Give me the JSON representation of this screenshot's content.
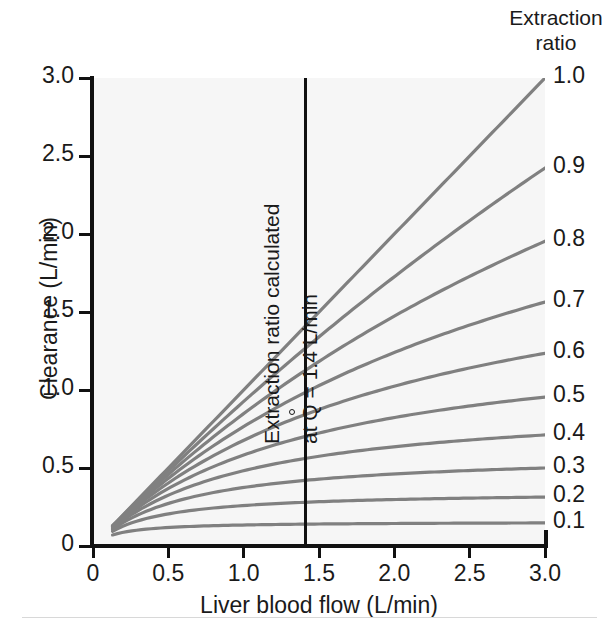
{
  "chart_data": {
    "type": "line",
    "title": "",
    "xlabel": "Liver blood flow (L/min)",
    "ylabel": "Clearance (L/min)",
    "xlim": [
      0,
      3.0
    ],
    "ylim": [
      0,
      3.0
    ],
    "xticks": [
      "0",
      "0.5",
      "1.0",
      "1.5",
      "2.0",
      "2.5",
      "3.0"
    ],
    "xtick_values": [
      0,
      0.5,
      1.0,
      1.5,
      2.0,
      2.5,
      3.0
    ],
    "yticks": [
      "0",
      "0.5",
      "1.0",
      "1.5",
      "2.0",
      "2.5",
      "3.0"
    ],
    "ytick_values": [
      0,
      0.5,
      1.0,
      1.5,
      2.0,
      2.5,
      3.0
    ],
    "grid": false,
    "legend_position": "right",
    "legend_title_line1": "Extraction",
    "legend_title_line2": "ratio",
    "series": [
      {
        "name": "1.0",
        "extraction_ratio": 1.0,
        "x": [
          0.13,
          0.5,
          1.0,
          1.4,
          1.5,
          2.0,
          2.5,
          3.0
        ],
        "values": [
          0.08,
          0.5,
          1.0,
          1.4,
          1.5,
          2.0,
          2.5,
          3.0
        ]
      },
      {
        "name": "0.9",
        "extraction_ratio": 0.9,
        "x": [
          0.13,
          0.5,
          1.0,
          1.4,
          1.5,
          2.0,
          2.5,
          3.0
        ],
        "values": [
          0.08,
          0.44,
          0.84,
          1.13,
          1.2,
          1.52,
          1.83,
          2.13
        ]
      },
      {
        "name": "0.8",
        "extraction_ratio": 0.8,
        "x": [
          0.13,
          0.5,
          1.0,
          1.4,
          1.5,
          2.0,
          2.5,
          3.0
        ],
        "values": [
          0.08,
          0.4,
          0.73,
          0.96,
          1.01,
          1.26,
          1.48,
          1.69
        ]
      },
      {
        "name": "0.7",
        "extraction_ratio": 0.7,
        "x": [
          0.13,
          0.5,
          1.0,
          1.4,
          1.5,
          2.0,
          2.5,
          3.0
        ],
        "values": [
          0.08,
          0.36,
          0.63,
          0.81,
          0.85,
          1.04,
          1.21,
          1.36
        ]
      },
      {
        "name": "0.6",
        "extraction_ratio": 0.6,
        "x": [
          0.13,
          0.5,
          1.0,
          1.4,
          1.5,
          2.0,
          2.5,
          3.0
        ],
        "values": [
          0.08,
          0.32,
          0.54,
          0.68,
          0.71,
          0.85,
          0.97,
          1.08
        ]
      },
      {
        "name": "0.5",
        "extraction_ratio": 0.5,
        "x": [
          0.13,
          0.5,
          1.0,
          1.4,
          1.5,
          2.0,
          2.5,
          3.0
        ],
        "values": [
          0.08,
          0.28,
          0.45,
          0.56,
          0.58,
          0.68,
          0.77,
          0.84
        ]
      },
      {
        "name": "0.4",
        "extraction_ratio": 0.4,
        "x": [
          0.13,
          0.5,
          1.0,
          1.4,
          1.5,
          2.0,
          2.5,
          3.0
        ],
        "values": [
          0.08,
          0.24,
          0.37,
          0.44,
          0.46,
          0.53,
          0.58,
          0.63
        ]
      },
      {
        "name": "0.3",
        "extraction_ratio": 0.3,
        "x": [
          0.13,
          0.5,
          1.0,
          1.4,
          1.5,
          2.0,
          2.5,
          3.0
        ],
        "values": [
          0.08,
          0.2,
          0.29,
          0.34,
          0.35,
          0.39,
          0.42,
          0.45
        ]
      },
      {
        "name": "0.2",
        "extraction_ratio": 0.2,
        "x": [
          0.13,
          0.5,
          1.0,
          1.4,
          1.5,
          2.0,
          2.5,
          3.0
        ],
        "values": [
          0.08,
          0.16,
          0.21,
          0.24,
          0.24,
          0.27,
          0.28,
          0.29
        ]
      },
      {
        "name": "0.1",
        "extraction_ratio": 0.1,
        "x": [
          0.13,
          0.5,
          1.0,
          1.4,
          1.5,
          2.0,
          2.5,
          3.0
        ],
        "values": [
          0.08,
          0.11,
          0.13,
          0.14,
          0.14,
          0.15,
          0.15,
          0.15
        ]
      }
    ],
    "annotations": [
      {
        "text": "Extraction ratio calculated",
        "orientation": "vertical"
      },
      {
        "text_prefix": "at ",
        "symbol": "Q",
        "text_suffix": " = 1.4 L/min",
        "orientation": "vertical"
      }
    ],
    "reference_line": {
      "x": 1.4,
      "orientation": "vertical",
      "color": "#111111"
    },
    "colors": {
      "curve": "#808080",
      "axis": "#111111",
      "plot_background": "#f6f6f6",
      "text": "#1a1a1a"
    }
  },
  "annotation": {
    "line1": "Extraction ratio calculated",
    "line2_prefix": "at ",
    "line2_symbol": "Q",
    "line2_suffix": " = 1.4 L/min"
  }
}
